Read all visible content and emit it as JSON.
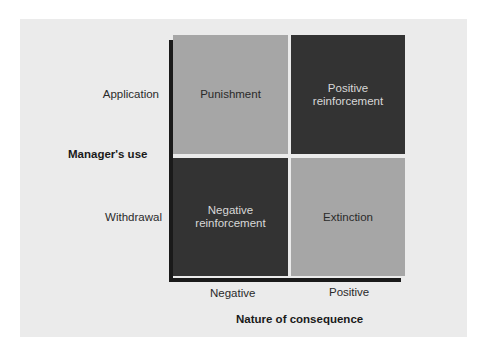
{
  "diagram": {
    "y_axis": {
      "title": "Manager's use",
      "rows": [
        "Application",
        "Withdrawal"
      ]
    },
    "x_axis": {
      "title": "Nature of consequence",
      "columns": [
        "Negative",
        "Positive"
      ]
    },
    "quadrants": {
      "application_negative": {
        "label": "Punishment",
        "shade": "light"
      },
      "application_positive": {
        "label_line1": "Positive",
        "label_line2": "reinforcement",
        "shade": "dark"
      },
      "withdrawal_negative": {
        "label_line1": "Negative",
        "label_line2": "reinforcement",
        "shade": "dark"
      },
      "withdrawal_positive": {
        "label": "Extinction",
        "shade": "light"
      }
    },
    "colors": {
      "background": "#ebebeb",
      "light_quadrant": "#a6a6a6",
      "dark_quadrant": "#333333",
      "axis": "#1a1a1a"
    }
  }
}
